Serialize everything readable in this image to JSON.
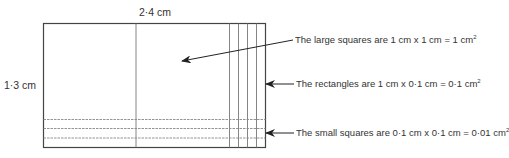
{
  "diagram": {
    "width_label": "2·4 cm",
    "height_label": "1·3 cm",
    "annotations": [
      {
        "id": "large",
        "text": "The large squares are 1 cm x 1 cm = 1 cm",
        "unit_sup": "2"
      },
      {
        "id": "rect",
        "text": "The rectangles are 1 cm x 0·1 cm = 0·1 cm",
        "unit_sup": "2"
      },
      {
        "id": "small",
        "text": "The small squares are 0·1 cm x 0·1 cm = 0·01 cm",
        "unit_sup": "2"
      }
    ],
    "colors": {
      "line": "#444444",
      "grid": "#777777",
      "text": "#333333"
    }
  }
}
